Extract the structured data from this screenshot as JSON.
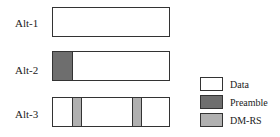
{
  "rows": [
    {
      "label": "Alt-1"
    },
    {
      "label": "Alt-2"
    },
    {
      "label": "Alt-3"
    }
  ],
  "legend": [
    {
      "label": "Data",
      "color": "#ffffff"
    },
    {
      "label": "Preamble",
      "color": "#6e6e6e"
    },
    {
      "label": "DM-RS",
      "color": "#b0b0b0"
    }
  ]
}
